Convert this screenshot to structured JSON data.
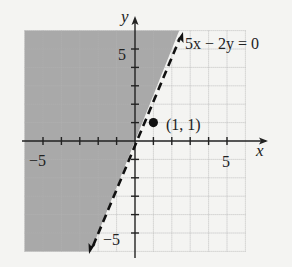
{
  "graph": {
    "title": "Graph of the inequality region bounded by 5x - 2y = 0",
    "x_axis_label": "x",
    "y_axis_label": "y",
    "x_tick_labels": [
      "−5",
      "5"
    ],
    "y_tick_labels": [
      "5",
      "−5"
    ],
    "grid_range": {
      "x": [
        -6,
        6
      ],
      "y": [
        -6,
        6
      ]
    },
    "boundary_line": {
      "equation_label": "5x − 2y = 0",
      "style": "dashed",
      "slope": 2.5,
      "intercept": 0
    },
    "test_point": {
      "label": "(1, 1)",
      "x": 1,
      "y": 1
    },
    "shaded_side": "left of line (5x − 2y < 0)",
    "colors": {
      "background": "#f4f4f2",
      "shade": "#a9a9a9",
      "grid_shaded": "#979797",
      "grid_unshaded": "#bdbdbd",
      "axis": "#222222"
    }
  }
}
